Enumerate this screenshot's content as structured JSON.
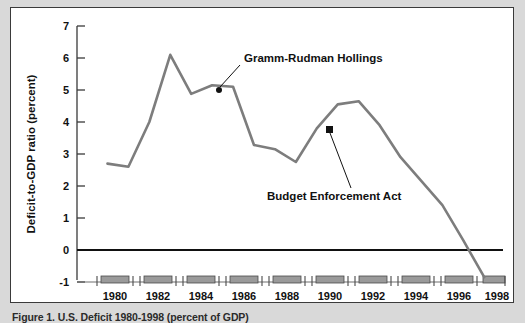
{
  "figure": {
    "caption": "Figure 1.  U.S. Deficit 1980-1998 (percent of GDP)",
    "panel_background": "#ffffff",
    "page_background": "#d9d9d9",
    "border_color": "#3a3a3a"
  },
  "chart_data": {
    "type": "line",
    "title": "",
    "xlabel": "",
    "ylabel": "Deficit-to-GDP ratio (percent)",
    "x": [
      1980,
      1981,
      1982,
      1983,
      1984,
      1985,
      1986,
      1987,
      1988,
      1989,
      1990,
      1991,
      1992,
      1993,
      1994,
      1995,
      1996,
      1997,
      1998
    ],
    "values": [
      2.7,
      2.6,
      4.0,
      6.1,
      4.88,
      5.15,
      5.1,
      3.28,
      3.15,
      2.75,
      3.8,
      4.55,
      4.65,
      3.9,
      2.9,
      2.15,
      1.4,
      0.3,
      -0.85
    ],
    "series": [
      {
        "name": "Deficit-to-GDP ratio",
        "color": "#7d7d7d",
        "values": [
          2.7,
          2.6,
          4.0,
          6.1,
          4.88,
          5.15,
          5.1,
          3.28,
          3.15,
          2.75,
          3.8,
          4.55,
          4.65,
          3.9,
          2.9,
          2.15,
          1.4,
          0.3,
          -0.85
        ]
      }
    ],
    "xlim": [
      1979.5,
      1998.8
    ],
    "ylim": [
      -1,
      7
    ],
    "ytick_labels": [
      "7",
      "6",
      "5",
      "4",
      "3",
      "2",
      "1",
      "0",
      "-1"
    ],
    "ytick_values": [
      7,
      6,
      5,
      4,
      3,
      2,
      1,
      0,
      -1
    ],
    "xtick_labels": [
      "1980",
      "1982",
      "1984",
      "1986",
      "1988",
      "1990",
      "1992",
      "1994",
      "1996",
      "1998"
    ],
    "xtick_values": [
      1980,
      1982,
      1984,
      1986,
      1988,
      1990,
      1992,
      1994,
      1996,
      1998
    ],
    "grid": false,
    "legend": "none",
    "zero_line": 0,
    "annotations": [
      {
        "text": "Gramm-Rudman Hollings",
        "point_x": 1985,
        "point_y": 5.15,
        "label_x": 1986.05,
        "label_y": 6.45
      },
      {
        "text": "Budget Enforcement Act",
        "point_x": 1990,
        "point_y": 3.8,
        "label_x": 1988.15,
        "label_y": 1.95
      }
    ],
    "axis_bar_marker_color": "#9a9a9a"
  }
}
